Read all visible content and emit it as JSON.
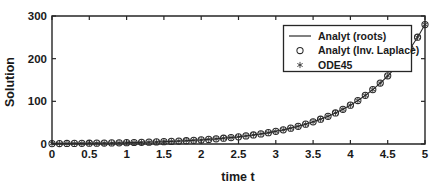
{
  "chart_data": {
    "type": "line",
    "title": "",
    "subtitle": "",
    "xlabel": "time t",
    "ylabel": "Solution",
    "xlim": [
      0,
      5
    ],
    "ylim": [
      0,
      300
    ],
    "grid": false,
    "legend_position": "top-right",
    "x_ticks": [
      "0",
      "0.5",
      "1",
      "1.5",
      "2",
      "2.5",
      "3",
      "3.5",
      "4",
      "4.5",
      "5"
    ],
    "x_tick_values": [
      0,
      0.5,
      1,
      1.5,
      2,
      2.5,
      3,
      3.5,
      4,
      4.5,
      5
    ],
    "y_ticks": [
      "0",
      "100",
      "200",
      "300"
    ],
    "y_tick_values": [
      0,
      100,
      200,
      300
    ],
    "x": [
      0,
      0.1,
      0.2,
      0.3,
      0.4,
      0.5,
      0.6,
      0.7,
      0.8,
      0.9,
      1,
      1.1,
      1.2,
      1.3,
      1.4,
      1.5,
      1.6,
      1.7,
      1.8,
      1.9,
      2,
      2.1,
      2.2,
      2.3,
      2.4,
      2.5,
      2.6,
      2.7,
      2.8,
      2.9,
      3,
      3.1,
      3.2,
      3.3,
      3.4,
      3.5,
      3.6,
      3.7,
      3.8,
      3.9,
      4,
      4.1,
      4.2,
      4.3,
      4.4,
      4.5,
      4.6,
      4.7,
      4.8,
      4.9,
      5
    ],
    "series": [
      {
        "name": "Analyt (roots)",
        "style": "line",
        "marker": "none",
        "color": "#2b2b2b",
        "values": [
          1,
          1.2,
          1.5,
          1.8,
          2.1,
          2.4,
          2.8,
          3.3,
          3.8,
          4.4,
          5.1,
          5.9,
          6.8,
          7.8,
          9,
          10.4,
          12,
          13.8,
          15.9,
          18.3,
          21.1,
          24.3,
          28,
          32.3,
          37.2,
          42.9,
          49.5,
          57.1,
          65.8,
          75.9,
          87.5,
          100.9,
          116.3,
          134.1,
          154.6,
          178.3,
          205.5,
          236.9,
          273.1,
          314.8,
          91.6,
          97.5,
          110.2,
          125.6,
          143.1,
          163.4,
          186.5,
          212.9,
          242.8,
          276.9,
          278
        ]
      },
      {
        "name": "Analyt (Inv. Laplace)",
        "style": "markers",
        "marker": "circle",
        "color": "#2b2b2b",
        "values": [
          1,
          1.2,
          1.5,
          1.8,
          2.1,
          2.4,
          2.8,
          3.3,
          3.8,
          4.4,
          5.1,
          5.9,
          6.8,
          7.8,
          9,
          10.4,
          12,
          13.8,
          15.9,
          18.3,
          21.1,
          24.3,
          28,
          32.3,
          37.2,
          42.9,
          49.5,
          57.1,
          65.8,
          75.9,
          87.5,
          100.9,
          116.3,
          134.1,
          154.6,
          178.3,
          205.5,
          236.9,
          273.1,
          314.8,
          91.6,
          97.5,
          110.2,
          125.6,
          143.1,
          163.4,
          186.5,
          212.9,
          242.8,
          276.9,
          278
        ]
      },
      {
        "name": "ODE45",
        "style": "markers",
        "marker": "asterisk",
        "color": "#2b2b2b",
        "values": [
          1,
          1.2,
          1.5,
          1.8,
          2.1,
          2.4,
          2.8,
          3.3,
          3.8,
          4.4,
          5.1,
          5.9,
          6.8,
          7.8,
          9,
          10.4,
          12,
          13.8,
          15.9,
          18.3,
          21.1,
          24.3,
          28,
          32.3,
          37.2,
          42.9,
          49.5,
          57.1,
          65.8,
          75.9,
          87.5,
          100.9,
          116.3,
          134.1,
          154.6,
          178.3,
          205.5,
          236.9,
          273.1,
          314.8,
          91.6,
          97.5,
          110.2,
          125.6,
          143.1,
          163.4,
          186.5,
          212.9,
          242.8,
          276.9,
          278
        ]
      }
    ],
    "legend_entries": [
      {
        "label": "Analyt (roots)",
        "marker": "line"
      },
      {
        "label": "Analyt (Inv. Laplace)",
        "marker": "circle"
      },
      {
        "label": "ODE45",
        "marker": "asterisk"
      }
    ]
  },
  "colors": {
    "axis": "#262626",
    "data": "#2b2b2b",
    "background": "#ffffff"
  }
}
